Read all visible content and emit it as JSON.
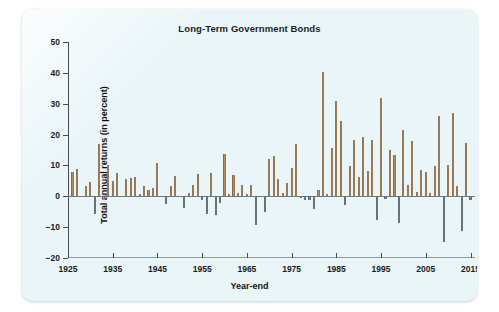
{
  "chart_data": {
    "type": "bar",
    "title": "Long-Term Government Bonds",
    "xlabel": "Year-end",
    "ylabel": "Total annual returns (in percent)",
    "ylim": [
      -20,
      50
    ],
    "ytick_labels": [
      "50",
      "40",
      "30",
      "20",
      "10",
      "0",
      "-10",
      "-20"
    ],
    "yticks": [
      50,
      40,
      30,
      20,
      10,
      0,
      -10,
      -20
    ],
    "xlim": [
      1925,
      2016
    ],
    "xtick_labels": [
      "1925",
      "1935",
      "1945",
      "1955",
      "1965",
      "1975",
      "1985",
      "1995",
      "2005",
      "2015"
    ],
    "xticks": [
      1925,
      1935,
      1945,
      1955,
      1965,
      1975,
      1985,
      1995,
      2005,
      2015
    ],
    "grid": false,
    "legend": "none",
    "positive_color": "#8a6a45",
    "negative_color": "#5a646a",
    "background_color": "#e9f5f7",
    "categories": [
      1926,
      1927,
      1928,
      1929,
      1930,
      1931,
      1932,
      1933,
      1934,
      1935,
      1936,
      1937,
      1938,
      1939,
      1940,
      1941,
      1942,
      1943,
      1944,
      1945,
      1946,
      1947,
      1948,
      1949,
      1950,
      1951,
      1952,
      1953,
      1954,
      1955,
      1956,
      1957,
      1958,
      1959,
      1960,
      1961,
      1962,
      1963,
      1964,
      1965,
      1966,
      1967,
      1968,
      1969,
      1970,
      1971,
      1972,
      1973,
      1974,
      1975,
      1976,
      1977,
      1978,
      1979,
      1980,
      1981,
      1982,
      1983,
      1984,
      1985,
      1986,
      1987,
      1988,
      1989,
      1990,
      1991,
      1992,
      1993,
      1994,
      1995,
      1996,
      1997,
      1998,
      1999,
      2000,
      2001,
      2002,
      2003,
      2004,
      2005,
      2006,
      2007,
      2008,
      2009,
      2010,
      2011,
      2012,
      2013,
      2014,
      2015
    ],
    "values": [
      7.8,
      8.9,
      0.1,
      3.4,
      4.7,
      -5.6,
      16.8,
      -0.1,
      10.0,
      5.0,
      7.5,
      0.2,
      5.5,
      5.9,
      6.1,
      0.9,
      3.2,
      2.1,
      2.8,
      10.7,
      -0.1,
      -2.6,
      3.4,
      6.5,
      0.1,
      -3.9,
      1.2,
      3.6,
      7.2,
      -1.2,
      -5.6,
      7.5,
      -6.1,
      -2.3,
      13.8,
      0.9,
      6.9,
      1.2,
      3.5,
      0.7,
      3.7,
      -9.2,
      -0.3,
      -5.1,
      12.1,
      13.2,
      5.7,
      1.1,
      4.4,
      9.2,
      16.8,
      -0.7,
      -1.2,
      -1.2,
      -4.0,
      1.9,
      40.4,
      0.7,
      15.5,
      31.0,
      24.5,
      -2.7,
      9.7,
      18.1,
      6.2,
      19.3,
      8.1,
      18.2,
      -7.8,
      31.7,
      -0.9,
      15.1,
      13.5,
      -8.7,
      21.5,
      3.7,
      17.8,
      1.4,
      8.5,
      7.8,
      1.2,
      9.9,
      25.9,
      -14.9,
      10.1,
      27.1,
      3.4,
      -11.1,
      17.3,
      -1.2
    ]
  }
}
